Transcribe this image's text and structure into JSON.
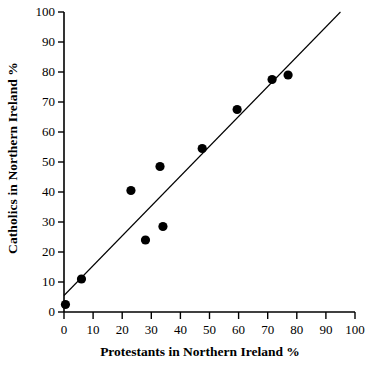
{
  "chart_data": {
    "type": "scatter",
    "title": "",
    "xlabel": "Protestants in Northern Ireland %",
    "ylabel": "Catholics in Northern Ireland %",
    "xlim": [
      0,
      100
    ],
    "ylim": [
      0,
      100
    ],
    "xticks": [
      0,
      10,
      20,
      30,
      40,
      50,
      60,
      70,
      80,
      90,
      100
    ],
    "yticks": [
      0,
      10,
      20,
      30,
      40,
      50,
      60,
      70,
      80,
      90,
      100
    ],
    "grid": false,
    "legend": null,
    "marker": "filled-circle",
    "marker_color": "#000000",
    "points": [
      {
        "x": 0.5,
        "y": 2.5
      },
      {
        "x": 6.0,
        "y": 11.0
      },
      {
        "x": 23.0,
        "y": 40.5
      },
      {
        "x": 28.0,
        "y": 24.0
      },
      {
        "x": 33.0,
        "y": 48.5
      },
      {
        "x": 34.0,
        "y": 28.5
      },
      {
        "x": 47.5,
        "y": 54.5
      },
      {
        "x": 59.5,
        "y": 67.5
      },
      {
        "x": 71.5,
        "y": 77.5
      },
      {
        "x": 77.0,
        "y": 79.0
      }
    ],
    "trendline": {
      "type": "line",
      "x": [
        0,
        95
      ],
      "y": [
        5.5,
        100
      ],
      "color": "#000000"
    }
  },
  "axis": {
    "x_tick_labels": [
      "0",
      "10",
      "20",
      "30",
      "40",
      "50",
      "60",
      "70",
      "80",
      "90",
      "100"
    ],
    "y_tick_labels": [
      "0",
      "10",
      "20",
      "30",
      "40",
      "50",
      "60",
      "70",
      "80",
      "90",
      "100"
    ],
    "x_title": "Protestants in Northern Ireland %",
    "y_title": "Catholics in Northern Ireland %"
  },
  "colors": {
    "axis": "#000000",
    "marker": "#000000",
    "line": "#000000",
    "background": "#ffffff"
  }
}
